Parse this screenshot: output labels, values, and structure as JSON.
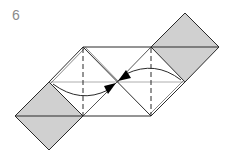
{
  "diagram": {
    "step_number": "6",
    "colors": {
      "fill_colored_side": "#d0d0d0",
      "line": "#2a2a2a",
      "faint_line": "#9a9a9a",
      "arrow": "#000000",
      "label": "#8a8a8a"
    },
    "elements": {
      "left_flap": "colored square flap, lower-left",
      "right_flap": "colored square flap, upper-right",
      "left_arrow": "curved arrow pointing right toward center",
      "right_arrow": "curved arrow pointing left toward center",
      "valley_folds": 2
    }
  }
}
